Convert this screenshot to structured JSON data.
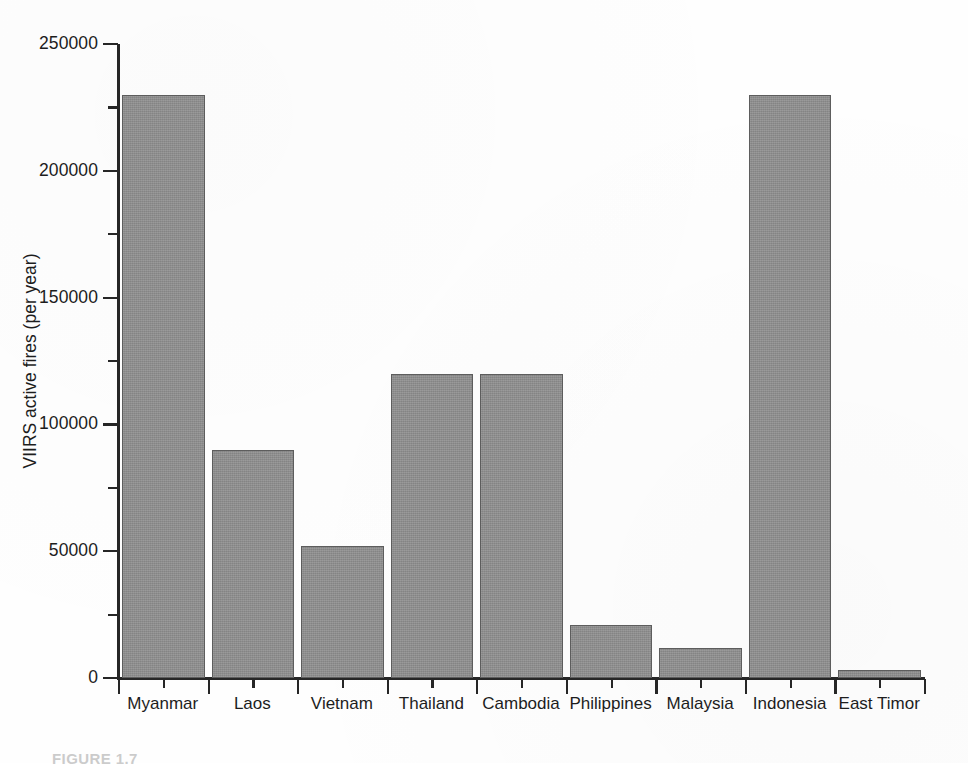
{
  "figure": {
    "caption_label": "FIGURE 1.7",
    "caption_text": ""
  },
  "chart_data": {
    "type": "bar",
    "title": "",
    "xlabel": "",
    "ylabel": "VIIRS active fires (per year)",
    "categories": [
      "Myanmar",
      "Laos",
      "Vietnam",
      "Thailand",
      "Cambodia",
      "Philippines",
      "Malaysia",
      "Indonesia",
      "East Timor"
    ],
    "values": [
      230000,
      90000,
      52000,
      120000,
      120000,
      21000,
      12000,
      230000,
      3000
    ],
    "ylim": [
      0,
      250000
    ],
    "xlim": [
      0,
      9
    ],
    "y_major_ticks": [
      0,
      50000,
      100000,
      150000,
      200000,
      250000
    ],
    "y_tick_labels": [
      "0",
      "50000",
      "100000",
      "150000",
      "200000",
      "250000"
    ],
    "y_minor_ticks": [
      25000,
      75000,
      125000,
      175000,
      225000
    ],
    "grid": false,
    "legend": false,
    "bar_color": "#919191",
    "bar_edge_color": "#5d5d5d",
    "axis_color": "#262626",
    "background": "#ffffff"
  }
}
